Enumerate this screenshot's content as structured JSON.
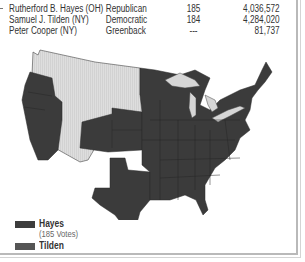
{
  "results": {
    "rows": [
      {
        "candidate": "Rutherford B. Hayes (OH)",
        "party": "Republican",
        "electoral_votes": "185",
        "popular_vote": "4,036,572"
      },
      {
        "candidate": "Samuel J. Tilden (NY)",
        "party": "Democratic",
        "electoral_votes": "184",
        "popular_vote": "4,284,020"
      },
      {
        "candidate": "Peter Cooper (NY)",
        "party": "Greenback",
        "electoral_votes": "---",
        "popular_vote": "81,737"
      }
    ]
  },
  "map": {
    "title": "1876 Presidential Election Map",
    "colors": {
      "hayes": "#dcdcdc",
      "tilden": "#3b3b3b",
      "state_border": "#2a2a2a",
      "lakes": "#d6d6d6"
    }
  },
  "legend": {
    "items": [
      {
        "label": "Hayes",
        "sublabel": "(185 Votes)",
        "color": "#3d3d3d"
      },
      {
        "label": "Tilden",
        "sublabel": "",
        "color": "#555555"
      }
    ]
  }
}
